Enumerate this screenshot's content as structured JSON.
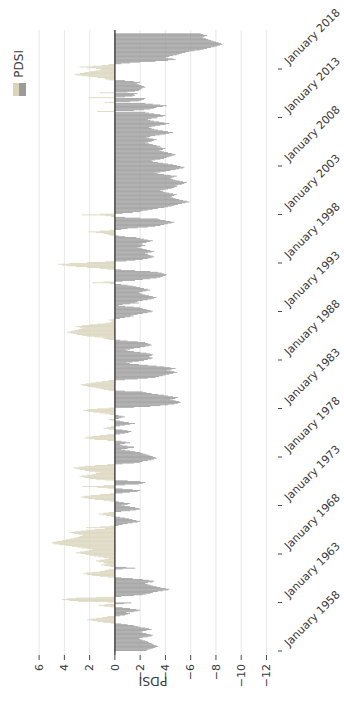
{
  "window": {
    "width": 344,
    "height": 706
  },
  "chart": {
    "rotation_degrees": -90,
    "legend": {
      "label": "PDSI",
      "swatch_top_color": "#d9d4ba",
      "swatch_bottom_color": "#9b9b9b"
    },
    "colors": {
      "positive_bar": "#d9d4ba",
      "negative_bar": "#9b9b9b",
      "zero_line": "#333333",
      "gridline": "#e7e7e7",
      "tick": "#4a4a4a",
      "text": "#3a3a3a",
      "background": "#ffffff"
    }
  },
  "chart_data": {
    "type": "bar",
    "title": "",
    "xlabel": "",
    "ylabel": "PDSI",
    "legend_entries": [
      "PDSI"
    ],
    "legend_position": "top-right",
    "grid": "value-axis gridlines only",
    "orientation_note": "entire figure displayed rotated 90 degrees counterclockwise",
    "x_frequency": "monthly",
    "x_start": "1958-01",
    "x_end": "2021-08",
    "x_tick_years": [
      1958,
      1963,
      1968,
      1973,
      1978,
      1983,
      1988,
      1993,
      1998,
      2003,
      2008,
      2013,
      2018
    ],
    "x_tick_labels": [
      "January 1958",
      "January 1963",
      "January 1968",
      "January 1973",
      "January 1978",
      "January 1983",
      "January 1988",
      "January 1993",
      "January 1998",
      "January 2003",
      "January 2008",
      "January 2013",
      "January 2018"
    ],
    "y_tick_values": [
      6,
      4,
      2,
      0,
      -2,
      -4,
      -6,
      -8,
      -10,
      -12
    ],
    "y_tick_labels": [
      "6",
      "4",
      "2",
      "0",
      "−2",
      "−4",
      "−6",
      "−8",
      "−10",
      "−12"
    ],
    "ylim": [
      -12.9,
      6.9
    ],
    "values": [
      -2.5,
      -2.6,
      -2.8,
      -3.0,
      -3.2,
      -3.4,
      -3.3,
      -3.1,
      -3.0,
      -2.9,
      -2.7,
      -2.6,
      -2.4,
      -2.2,
      -2.0,
      -1.9,
      -2.2,
      -2.6,
      -2.9,
      -3.0,
      -2.8,
      -2.5,
      -2.2,
      -2.0,
      -2.2,
      -2.5,
      -2.9,
      -2.7,
      -2.4,
      -2.0,
      -1.8,
      -1.5,
      -1.0,
      -0.5,
      0.3,
      0.9,
      1.4,
      1.8,
      2.2,
      1.9,
      1.5,
      1.0,
      0.6,
      -0.4,
      -0.8,
      -1.0,
      -1.2,
      -0.9,
      -1.5,
      -1.8,
      -2.0,
      -1.7,
      -1.2,
      -0.6,
      0.4,
      0.9,
      1.3,
      0.8,
      -0.7,
      -1.3,
      0.6,
      2.9,
      3.6,
      4.2,
      3.8,
      3.1,
      1.5,
      -0.5,
      -1.5,
      -2.2,
      -2.5,
      -2.8,
      -3.0,
      -3.4,
      -3.8,
      -4.2,
      -4.3,
      -4.0,
      -3.6,
      -3.3,
      -3.0,
      -2.8,
      -2.6,
      -2.4,
      -2.6,
      -3.0,
      -3.1,
      -2.7,
      -2.2,
      -1.4,
      -0.5,
      0.6,
      1.2,
      1.8,
      2.2,
      2.5,
      2.3,
      1.8,
      1.2,
      0.8,
      0.5,
      -0.6,
      -1.6,
      -0.9,
      0.4,
      0.8,
      1.1,
      0.9,
      0.6,
      0.9,
      1.3,
      1.5,
      1.2,
      0.8,
      0.5,
      0.9,
      1.3,
      1.7,
      2.0,
      2.3,
      2.7,
      3.1,
      2.8,
      2.4,
      2.0,
      1.8,
      2.2,
      2.6,
      3.0,
      3.4,
      3.9,
      4.4,
      4.8,
      5.0,
      4.9,
      4.6,
      4.2,
      3.9,
      3.6,
      3.3,
      3.0,
      2.8,
      2.6,
      2.5,
      2.9,
      3.3,
      3.6,
      3.2,
      2.7,
      2.3,
      1.6,
      0.8,
      2.3,
      1.2,
      0.4,
      -0.3,
      -0.6,
      -1.0,
      -1.4,
      -1.8,
      -2.0,
      -1.7,
      -1.4,
      -1.1,
      -0.8,
      -0.4,
      0.3,
      0.7,
      1.0,
      1.3,
      0.9,
      0.5,
      -0.5,
      -1.2,
      -1.7,
      -2.0,
      -1.9,
      -1.6,
      -1.2,
      -0.8,
      -0.5,
      -1.0,
      -1.2,
      -0.7,
      -0.3,
      0.4,
      0.9,
      1.6,
      2.1,
      2.5,
      2.7,
      2.4,
      1.9,
      1.2,
      0.4,
      -0.6,
      -1.2,
      -1.8,
      -2.0,
      -1.4,
      -0.6,
      0.6,
      1.4,
      2.6,
      0.9,
      -0.8,
      -1.9,
      -2.2,
      -2.4,
      -2.0,
      -1.0,
      0.8,
      1.5,
      2.0,
      2.4,
      2.8,
      2.6,
      2.2,
      1.8,
      1.5,
      1.2,
      1.6,
      2.0,
      2.4,
      2.8,
      3.1,
      3.3,
      2.9,
      2.4,
      1.6,
      0.6,
      -0.6,
      -1.5,
      -2.0,
      -2.2,
      -2.6,
      -2.9,
      -3.1,
      -3.3,
      -3.2,
      -3.0,
      -2.8,
      -2.6,
      -2.4,
      -2.2,
      -2.0,
      -1.6,
      -1.2,
      -0.8,
      -0.5,
      -1.0,
      -1.5,
      -1.5,
      -1.0,
      -0.6,
      -0.4,
      -0.8,
      -1.2,
      -0.9,
      -0.5,
      0.6,
      1.6,
      2.0,
      2.4,
      2.2,
      1.8,
      1.2,
      0.6,
      -0.4,
      -0.8,
      -1.1,
      -1.3,
      -1.0,
      -0.6,
      0.5,
      0.9,
      0.6,
      0.3,
      -0.4,
      -0.8,
      -1.2,
      -1.6,
      -1.1,
      -0.7,
      -0.4,
      0.3,
      0.5,
      -0.3,
      -0.5,
      -0.8,
      -0.6,
      -0.3,
      0.4,
      0.8,
      1.2,
      1.7,
      2.1,
      2.5,
      2.2,
      1.4,
      0.5,
      -1.5,
      -2.8,
      -3.6,
      -4.2,
      -4.7,
      -5.0,
      -5.2,
      -5.1,
      -4.8,
      -4.6,
      -4.4,
      -4.8,
      -5.0,
      -4.6,
      -4.2,
      -3.9,
      -3.4,
      -2.9,
      -2.5,
      -2.2,
      -0.8,
      0.5,
      0.9,
      1.2,
      1.5,
      1.8,
      2.2,
      2.5,
      2.7,
      2.3,
      1.9,
      1.5,
      1.0,
      0.5,
      -0.8,
      -1.8,
      -2.6,
      -3.2,
      -3.5,
      -3.8,
      -4.0,
      -4.3,
      -4.6,
      -4.9,
      -4.7,
      -4.4,
      -4.1,
      -4.5,
      -4.8,
      -4.4,
      -3.9,
      -3.3,
      -2.6,
      -1.9,
      -1.2,
      -0.9,
      -1.4,
      -1.9,
      -2.3,
      -2.6,
      -2.9,
      -3.0,
      -2.8,
      -2.7,
      -2.9,
      -3.0,
      -2.8,
      -2.5,
      -2.0,
      -1.5,
      -1.0,
      -0.8,
      -1.2,
      -1.5,
      -2.0,
      -2.4,
      -2.7,
      -2.9,
      -2.8,
      -2.6,
      -2.4,
      -1.8,
      -1.0,
      -0.4,
      0.5,
      0.8,
      1.0,
      1.6,
      2.2,
      2.6,
      3.0,
      3.3,
      3.6,
      3.8,
      3.5,
      3.2,
      2.9,
      2.7,
      2.5,
      2.8,
      3.1,
      2.6,
      2.0,
      1.4,
      0.8,
      0.4,
      0.2,
      0.3,
      0.5,
      0.2,
      -0.4,
      -0.8,
      -1.2,
      -1.5,
      -1.3,
      -1.8,
      -2.2,
      -2.6,
      -2.9,
      -3.0,
      -2.8,
      -2.5,
      -2.2,
      -2.0,
      -1.5,
      -0.8,
      -0.3,
      -0.6,
      -1.2,
      -1.9,
      -1.6,
      -1.8,
      -2.2,
      -2.6,
      -2.9,
      -3.1,
      -3.3,
      -3.0,
      -2.7,
      -2.4,
      -2.2,
      -2.0,
      -1.9,
      -2.2,
      -2.5,
      -2.8,
      -2.6,
      -2.3,
      -2.0,
      -1.7,
      -1.4,
      -1.0,
      -0.5,
      0.4,
      1.8,
      0.9,
      -0.6,
      -1.6,
      -2.2,
      -2.8,
      -3.3,
      -3.6,
      -3.8,
      -4.0,
      -4.1,
      -3.9,
      -3.7,
      -3.4,
      -2.8,
      -1.6,
      -0.5,
      0.6,
      1.2,
      2.2,
      3.1,
      3.8,
      4.2,
      4.5,
      3.6,
      2.2,
      0.8,
      -0.9,
      -1.6,
      -2.2,
      -2.6,
      -2.9,
      -3.1,
      -3.0,
      -2.8,
      -2.6,
      -2.4,
      -2.6,
      -2.9,
      -3.1,
      -2.8,
      -2.5,
      -2.2,
      -2.0,
      -1.8,
      -2.1,
      -2.4,
      -2.2,
      -1.9,
      -2.2,
      -2.5,
      -2.8,
      -3.0,
      -2.6,
      -2.3,
      -2.0,
      -1.7,
      -0.8,
      -0.3,
      0.4,
      0.6,
      0.9,
      1.5,
      2.1,
      1.2,
      0.4,
      -0.5,
      -1.0,
      -1.8,
      -2.6,
      -3.2,
      -3.6,
      -3.9,
      -4.2,
      -4.5,
      -4.7,
      -4.4,
      -4.0,
      -3.6,
      -3.4,
      -2.0,
      -0.8,
      0.3,
      0.8,
      2.6,
      1.2,
      -0.6,
      -1.4,
      -2.0,
      -2.2,
      -2.6,
      -3.0,
      -3.4,
      -3.9,
      -4.2,
      -4.5,
      -4.7,
      -5.0,
      -5.3,
      -5.6,
      -5.9,
      -5.7,
      -5.4,
      -5.1,
      -4.8,
      -4.6,
      -4.4,
      -4.5,
      -4.7,
      -4.9,
      -4.6,
      -4.3,
      -4.0,
      -3.8,
      -3.6,
      -3.9,
      -4.2,
      -4.5,
      -4.7,
      -4.9,
      -4.8,
      -5.0,
      -5.3,
      -5.5,
      -5.7,
      -5.4,
      -5.1,
      -4.8,
      -4.6,
      -4.4,
      -4.5,
      -4.7,
      -4.9,
      -4.4,
      -3.9,
      -3.4,
      -3.2,
      -3.6,
      -4.0,
      -4.4,
      -4.8,
      -5.1,
      -5.4,
      -5.5,
      -5.2,
      -4.9,
      -4.6,
      -4.2,
      -3.8,
      -3.4,
      -3.0,
      -2.9,
      -3.2,
      -3.6,
      -3.9,
      -4.1,
      -4.3,
      -4.5,
      -4.7,
      -4.8,
      -4.5,
      -4.2,
      -3.9,
      -3.7,
      -3.5,
      -3.8,
      -4.0,
      -3.7,
      -3.4,
      -3.6,
      -3.3,
      -3.0,
      -2.7,
      -2.4,
      -2.6,
      -2.9,
      -3.1,
      -3.3,
      -3.0,
      -2.7,
      -2.5,
      -2.8,
      -3.2,
      -3.6,
      -4.0,
      -4.3,
      -4.6,
      -4.2,
      -3.8,
      -3.4,
      -3.1,
      -2.9,
      -2.7,
      -2.9,
      -3.2,
      -3.6,
      -4.0,
      -4.3,
      -3.9,
      -3.5,
      -3.1,
      -2.8,
      -2.6,
      -2.9,
      -3.3,
      -3.4,
      -3.8,
      -4.0,
      -3.6,
      -3.1,
      -2.7,
      -2.4,
      1.4,
      -1.5,
      -2.3,
      -2.8,
      -3.1,
      -3.3,
      -3.8,
      -4.1,
      -3.6,
      -3.0,
      -2.4,
      0.8,
      -1.2,
      -1.9,
      -2.1,
      -2.3,
      -2.4,
      2.1,
      -0.8,
      -1.4,
      -1.6,
      -1.5,
      -1.8,
      1.2,
      -1.0,
      -1.6,
      -1.9,
      -2.0,
      -2.1,
      -2.2,
      -2.4,
      -2.3,
      -2.1,
      -1.9,
      -1.7,
      -1.8,
      -2.0,
      -1.5,
      -0.8,
      0.5,
      0.7,
      0.8,
      1.4,
      2.0,
      2.6,
      3.0,
      3.2,
      2.8,
      2.4,
      2.0,
      1.6,
      1.3,
      1.1,
      1.5,
      2.2,
      2.8,
      1.8,
      1.0,
      0.5,
      -0.5,
      -1.2,
      -2.0,
      -3.2,
      -4.2,
      -4.8,
      -4.6,
      -4.2,
      -4.0,
      -4.3,
      -4.6,
      -4.9,
      -5.1,
      -5.3,
      -5.6,
      -5.9,
      -6.3,
      -6.7,
      -7.0,
      -7.3,
      -7.6,
      -7.9,
      -8.1,
      -8.3,
      -8.5,
      -8.4,
      -8.2,
      -8.0,
      -7.8,
      -7.6,
      -7.4,
      -7.2,
      -7.0,
      -6.9,
      -7.1,
      -7.3,
      -7.0,
      -6.8
    ]
  }
}
